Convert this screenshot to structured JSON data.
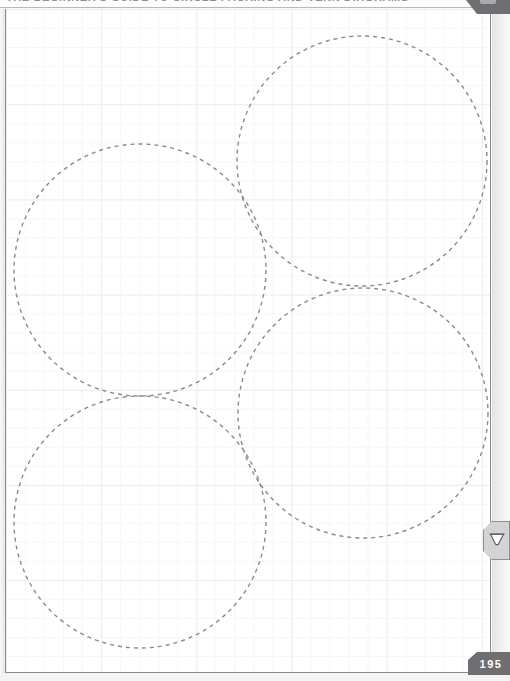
{
  "app": {
    "header": {
      "title": "THE BEGINNER'S GUIDE TO CIRCLE PACKING AND VENN DIAGRAMS",
      "corner_tab_icon": "corner-tab-icon"
    },
    "page": {
      "number": "195",
      "grid_style": "graph-paper",
      "grid_minor_spacing_px": 19,
      "grid_major_spacing_px": 95,
      "grid_minor_color": "#f5f6f7",
      "grid_major_color": "#eceef0",
      "background_color": "#ffffff",
      "border_color": "#8a8a8e"
    },
    "edge_tool": {
      "icon": "trash-icon",
      "label": "Delete"
    },
    "theme": {
      "accent": "#6e6e73",
      "stroke": "#8e8e93",
      "badge_text": "#ffffff",
      "gutter": "#e4e4e6"
    }
  },
  "chart_data": {
    "type": "scatter",
    "xlabel": "",
    "ylabel": "",
    "xlim": [
      0,
      510
    ],
    "ylim": [
      0,
      681
    ],
    "grid": true,
    "legend": "none",
    "stroke_color": "#8a8a8e",
    "stroke_width": 1.4,
    "dash_pattern": "4 4",
    "fill": "none",
    "series": [
      {
        "name": "circles",
        "points": [
          {
            "id": "circle-top-right",
            "cx": 362,
            "cy": 161,
            "r": 125
          },
          {
            "id": "circle-top-left",
            "cx": 140,
            "cy": 270,
            "r": 126
          },
          {
            "id": "circle-bottom-right",
            "cx": 363,
            "cy": 413,
            "r": 125
          },
          {
            "id": "circle-bottom-left",
            "cx": 140,
            "cy": 522,
            "r": 126
          }
        ]
      }
    ]
  }
}
